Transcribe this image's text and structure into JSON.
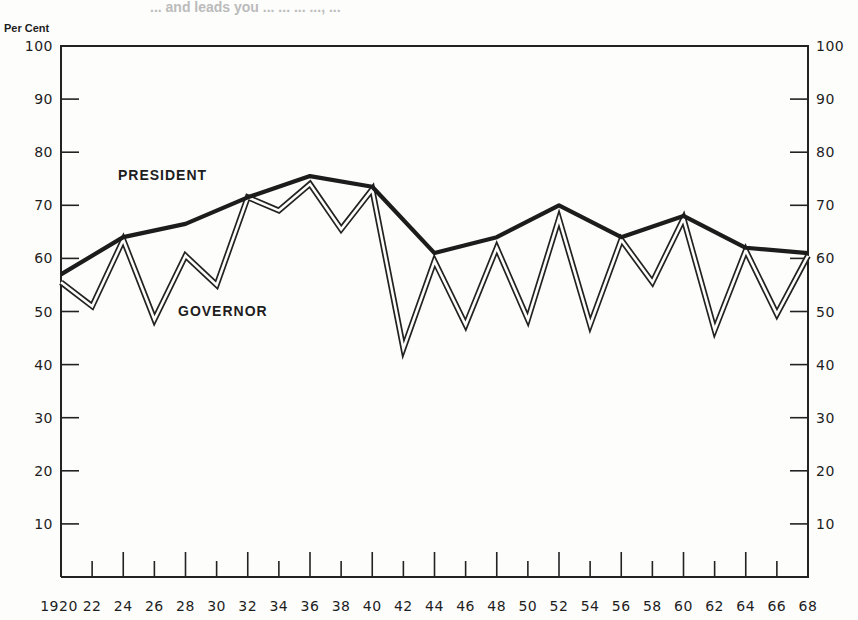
{
  "header": {
    "title_fragment": "... and leads you ... ... ... ..., ..."
  },
  "chart_data": {
    "type": "line",
    "title": "",
    "xlabel": "",
    "ylabel": "Per Cent",
    "ylim": [
      0,
      100
    ],
    "xlim": [
      1920,
      1968
    ],
    "grid": false,
    "legend": "inline labels",
    "y_ticks": [
      10,
      20,
      30,
      40,
      50,
      60,
      70,
      80,
      90,
      100
    ],
    "x_tick_labels": [
      "1920",
      "22",
      "24",
      "26",
      "28",
      "30",
      "32",
      "34",
      "36",
      "38",
      "40",
      "42",
      "44",
      "46",
      "48",
      "50",
      "52",
      "54",
      "56",
      "58",
      "60",
      "62",
      "64",
      "66",
      "68"
    ],
    "series": [
      {
        "name": "PRESIDENT",
        "style": "thick solid",
        "x": [
          1920,
          1924,
          1928,
          1932,
          1936,
          1940,
          1944,
          1948,
          1952,
          1956,
          1960,
          1964,
          1968
        ],
        "values": [
          57,
          64,
          66.5,
          71.5,
          75.5,
          73.5,
          61,
          64,
          70,
          64,
          68,
          62,
          61
        ]
      },
      {
        "name": "GOVERNOR",
        "style": "double outline",
        "x": [
          1920,
          1922,
          1924,
          1926,
          1928,
          1930,
          1932,
          1934,
          1936,
          1938,
          1940,
          1942,
          1944,
          1946,
          1948,
          1950,
          1952,
          1954,
          1956,
          1958,
          1960,
          1962,
          1964,
          1966,
          1968
        ],
        "values": [
          55.5,
          51,
          63.5,
          48.5,
          60.5,
          55,
          71.5,
          69,
          74,
          65.5,
          73,
          43,
          59.5,
          47.5,
          62,
          48.5,
          67.5,
          47.5,
          63.5,
          55.5,
          67.5,
          46.5,
          61.5,
          49.5,
          60.5
        ]
      }
    ],
    "annotations": [
      {
        "text": "PRESIDENT",
        "near": [
          1925,
          77
        ]
      },
      {
        "text": "GOVERNOR",
        "near": [
          1930,
          51
        ]
      }
    ]
  }
}
